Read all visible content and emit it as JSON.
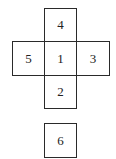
{
  "diagram": {
    "type": "cube-net",
    "faces": [
      {
        "label": "4",
        "position": "top",
        "x": 44,
        "y": 8,
        "w": 33,
        "h": 34
      },
      {
        "label": "5",
        "position": "left",
        "x": 12,
        "y": 41,
        "w": 33,
        "h": 35
      },
      {
        "label": "1",
        "position": "center",
        "x": 44,
        "y": 41,
        "w": 33,
        "h": 35
      },
      {
        "label": "3",
        "position": "right",
        "x": 76,
        "y": 41,
        "w": 34,
        "h": 35
      },
      {
        "label": "2",
        "position": "bottom",
        "x": 44,
        "y": 75,
        "w": 33,
        "h": 34
      },
      {
        "label": "6",
        "position": "detached",
        "x": 44,
        "y": 123,
        "w": 33,
        "h": 35
      }
    ]
  }
}
